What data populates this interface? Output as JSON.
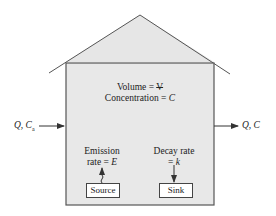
{
  "diagram": {
    "type": "box-model / house",
    "colors": {
      "fill": "#e8e8e8",
      "stroke": "#555555",
      "text": "#222222"
    },
    "interior": {
      "volume_label": "Volume = ",
      "volume_symbol": "V",
      "concentration_label": "Concentration = ",
      "concentration_symbol": "C"
    },
    "inflow": {
      "label": "Q, C",
      "subscript": "a"
    },
    "outflow": {
      "label": "Q, C"
    },
    "emission": {
      "line1": "Emission",
      "line2": "rate = ",
      "symbol": "E"
    },
    "decay": {
      "line1": "Decay rate",
      "line2": "= ",
      "symbol": "k"
    },
    "source_label": "Source",
    "sink_label": "Sink"
  }
}
